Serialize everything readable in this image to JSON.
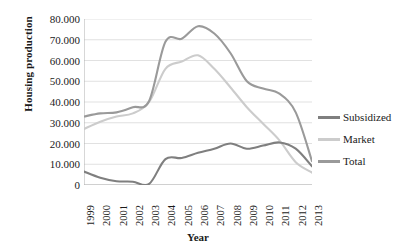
{
  "chart_data": {
    "type": "line",
    "title": "",
    "xlabel": "Year",
    "ylabel": "Housing production",
    "x": [
      1999,
      2000,
      2001,
      2002,
      2003,
      2004,
      2005,
      2006,
      2007,
      2008,
      2009,
      2010,
      2011,
      2012,
      2013
    ],
    "categories": [
      "1999",
      "2000",
      "2001",
      "2002",
      "2003",
      "2004",
      "2005",
      "2006",
      "2007",
      "2008",
      "2009",
      "2010",
      "2011",
      "2012",
      "2013"
    ],
    "ylim": [
      0,
      80000
    ],
    "ytick_values": [
      0,
      10000,
      20000,
      30000,
      40000,
      50000,
      60000,
      70000,
      80000
    ],
    "ytick_labels": [
      "0",
      "10.000",
      "20.000",
      "30.000",
      "40.000",
      "50.000",
      "60.000",
      "70.000",
      "80.000"
    ],
    "grid": "horizontal",
    "legend_position": "right",
    "series": [
      {
        "name": "Subsidized",
        "color": "#7f7f7f",
        "values": [
          6500,
          3500,
          1800,
          1600,
          500,
          12500,
          13000,
          15500,
          17500,
          20000,
          17500,
          19000,
          20500,
          17500,
          9000
        ]
      },
      {
        "name": "Market",
        "color": "#cccccc",
        "values": [
          27000,
          30500,
          33000,
          34500,
          40000,
          56000,
          59500,
          62500,
          56000,
          47000,
          37500,
          29500,
          21500,
          11000,
          6000
        ]
      },
      {
        "name": "Total",
        "color": "#9a9a9a",
        "values": [
          33000,
          34500,
          35000,
          37500,
          40500,
          69000,
          70500,
          76500,
          73000,
          63500,
          50000,
          46500,
          44000,
          35000,
          11500
        ]
      }
    ]
  },
  "legend": {
    "items": [
      {
        "label": "Subsidized",
        "color": "#7f7f7f"
      },
      {
        "label": "Market",
        "color": "#cccccc"
      },
      {
        "label": "Total",
        "color": "#9a9a9a"
      }
    ]
  },
  "axes": {
    "y_title": "Housing production",
    "x_title": "Year"
  }
}
